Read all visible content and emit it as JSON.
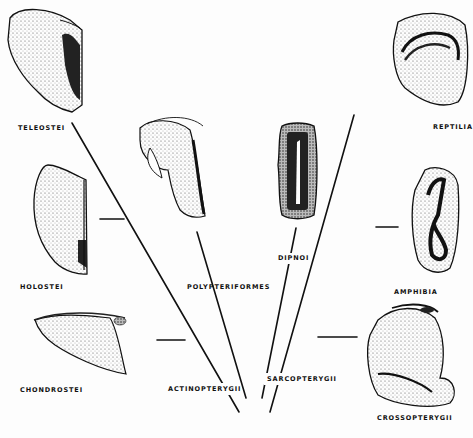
{
  "diagram": {
    "type": "phylogenetic-tree",
    "colors": {
      "ink": "#111111",
      "background": "#fdfdfd",
      "stipple": "#555555"
    },
    "clades": [
      {
        "id": "actinopterygii",
        "label": "ACTINOPTERYGII"
      },
      {
        "id": "sarcopterygii",
        "label": "SARCOPTERYGII"
      }
    ],
    "taxa": [
      {
        "id": "teleostei",
        "label": "TELEOSTEI"
      },
      {
        "id": "holostei",
        "label": "HOLOSTEI"
      },
      {
        "id": "chondrostei",
        "label": "CHONDROSTEI"
      },
      {
        "id": "polypteriformes",
        "label": "POLYPTERIFORMES"
      },
      {
        "id": "dipnoi",
        "label": "DIPNOI"
      },
      {
        "id": "reptilia",
        "label": "REPTILIA"
      },
      {
        "id": "amphibia",
        "label": "AMPHIBIA"
      },
      {
        "id": "crossopterygii",
        "label": "CROSSOPTERYGII"
      }
    ]
  }
}
